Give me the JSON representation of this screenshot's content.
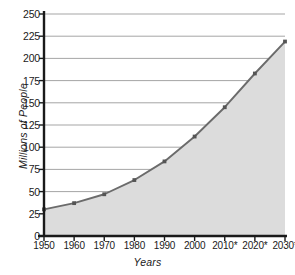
{
  "chart_data": {
    "type": "area",
    "title": "",
    "xlabel": "Years",
    "ylabel": "Millions of People",
    "categories": [
      "1950",
      "1960",
      "1970",
      "1980",
      "1990",
      "2000",
      "2010*",
      "2020*",
      "2030*"
    ],
    "x": [
      1950,
      1960,
      1970,
      1980,
      1990,
      2000,
      2010,
      2020,
      2030
    ],
    "values": [
      30,
      37,
      47,
      63,
      84,
      112,
      145,
      183,
      219
    ],
    "series": [
      {
        "name": "Millions of People",
        "values": [
          30,
          37,
          47,
          63,
          84,
          112,
          145,
          183,
          219
        ]
      }
    ],
    "ylim": [
      0,
      250
    ],
    "yticks": [
      0,
      25,
      50,
      75,
      100,
      125,
      150,
      175,
      200,
      225,
      250
    ],
    "ytick_labels": [
      "0",
      "25",
      "50",
      "75",
      "100",
      "125",
      "150",
      "175",
      "200",
      "225",
      "250"
    ],
    "xtick_labels": [
      "1950",
      "1960",
      "1970",
      "1980",
      "1990",
      "2000",
      "2010*",
      "2020*",
      "2030*"
    ],
    "grid": true,
    "grid_axis": "y",
    "legend": false,
    "legend_position": "none",
    "markers": true,
    "fill": true,
    "annotations": [
      "* indicates projected value"
    ],
    "colors": {
      "line": "#6b6b6b",
      "marker": "#555555",
      "fill": "#dcdcdc",
      "grid": "#9b9b9b",
      "axis": "#1a1a1a",
      "background": "#ffffff",
      "text": "#1a1a1a"
    }
  },
  "footnote": ""
}
